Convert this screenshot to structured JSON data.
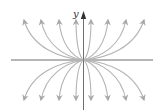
{
  "figure": {
    "type": "phase-portrait",
    "axes": {
      "y_label": "y",
      "x_label": ""
    },
    "colors": {
      "axis": "#6e6e6e",
      "trajectory": "#b3b3b3",
      "axis_arrowhead": "#333333",
      "background": "#ffffff"
    },
    "trajectory_count": 16,
    "trajectories_upper_x_ends": [
      25,
      42,
      60,
      77,
      91,
      108,
      126,
      144
    ],
    "trajectories_lower_x_ends": [
      25,
      42,
      60,
      77,
      91,
      108,
      126,
      144
    ]
  }
}
